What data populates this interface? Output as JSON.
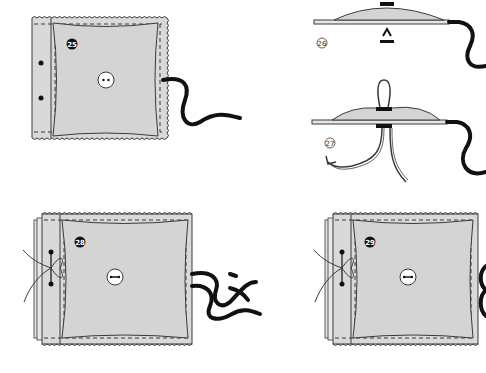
{
  "diagram": {
    "type": "sewing-instructions",
    "colors": {
      "fabric": "#d9d9d9",
      "outline": "#3a3a3a",
      "cord": "#111111",
      "background": "#ffffff",
      "step_badge": "#111111",
      "step_badge_text": "#ffffff"
    },
    "panels": [
      {
        "id": "step-25",
        "step": "25",
        "style": "filled",
        "description": "Fabric square with two-hole button, cord exiting right side, two dots on left hem"
      },
      {
        "id": "step-26",
        "step": "26",
        "style": "outline",
        "description": "Side view: padded fabric on base with button on top and arrow pointing up from below"
      },
      {
        "id": "step-27",
        "step": "27",
        "style": "outline",
        "description": "Side view: thread loop through button, two thread ends below, one pulled with arrow"
      },
      {
        "id": "step-28",
        "step": "28",
        "style": "filled",
        "description": "Stacked fabric squares with shank button, tied thread on left edge, two cords exiting right"
      },
      {
        "id": "step-29",
        "step": "29",
        "style": "filled",
        "description": "Stacked fabric squares with shank button, tied thread on left edge, cords at right edge"
      }
    ]
  }
}
